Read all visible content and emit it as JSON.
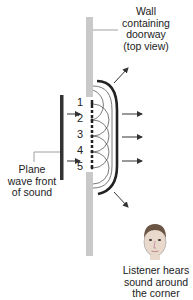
{
  "labels": {
    "wall": [
      "Wall",
      "containing",
      "doorway",
      "(top view)"
    ],
    "plane_wave": [
      "Plane",
      "wave front",
      "of sound"
    ],
    "listener": [
      "Listener hears",
      "sound around",
      "the corner"
    ]
  },
  "sources": [
    "1",
    "2",
    "3",
    "4",
    "5"
  ],
  "colors": {
    "wall": "#c9c9c9",
    "wavefront": "#333333",
    "text": "#222222"
  }
}
